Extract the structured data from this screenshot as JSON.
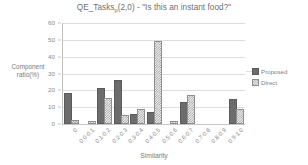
{
  "chart_data": {
    "type": "bar",
    "title_main": "QE_Tasks",
    "title_subscript": "p",
    "title_rest": "(2,0) - \"Is this an instant food?\"",
    "xlabel": "Similarity",
    "ylabel": "Component ratio(%)",
    "ylabel_line1": "Component",
    "ylabel_line2": "ratio(%)",
    "ylim": [
      0,
      60
    ],
    "ytick_step": 10,
    "yticks": [
      "0",
      "10",
      "20",
      "30",
      "40",
      "50",
      "60"
    ],
    "grid": true,
    "grid_axis": "y",
    "legend_position": "right",
    "categories": [
      "0",
      "0.0-0.1",
      "0.1-0.2",
      "0.2-0.3",
      "0.3-0.4",
      "0.4-0.5",
      "0.5-0.6",
      "0.6-0.7",
      "0.7-0.8",
      "0.8-0.9",
      "0.9-1.0"
    ],
    "series": [
      {
        "name": "Proposed",
        "color": "#6c6c6c",
        "pattern": "solid",
        "values": [
          17,
          0,
          20.5,
          25,
          5,
          6,
          0,
          12,
          0,
          0,
          13.5
        ]
      },
      {
        "name": "Direct",
        "color": "#9a9a9a",
        "pattern": "checkered",
        "values": [
          1,
          0.4,
          14,
          4,
          8,
          48,
          0.5,
          16,
          0,
          0,
          8
        ]
      }
    ]
  }
}
